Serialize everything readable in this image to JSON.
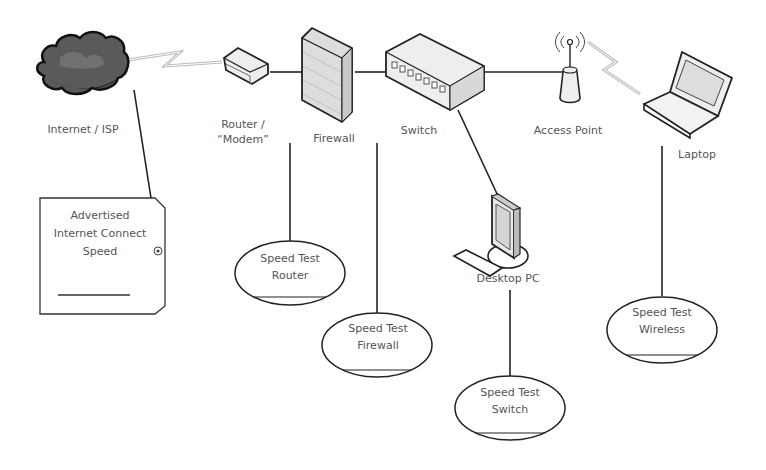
{
  "diagram": {
    "nodes": {
      "internet": {
        "label": "Internet / ISP"
      },
      "router": {
        "label_line1": "Router /",
        "label_line2": "“Modem”"
      },
      "firewall": {
        "label": "Firewall"
      },
      "switch": {
        "label": "Switch"
      },
      "access_point": {
        "label": "Access Point"
      },
      "laptop": {
        "label": "Laptop"
      },
      "desktop": {
        "label": "Desktop PC"
      }
    },
    "tags": {
      "advertised": {
        "line1": "Advertised",
        "line2": "Internet Connect",
        "line3": "Speed"
      },
      "speed_router": {
        "line1": "Speed Test",
        "line2": "Router"
      },
      "speed_firewall": {
        "line1": "Speed Test",
        "line2": "Firewall"
      },
      "speed_switch": {
        "line1": "Speed Test",
        "line2": "Switch"
      },
      "speed_wireless": {
        "line1": "Speed Test",
        "line2": "Wireless"
      }
    },
    "colors": {
      "line": "#222222",
      "label": "#555555",
      "cloud": "#555555",
      "device_fill": "#eeeeee"
    }
  }
}
